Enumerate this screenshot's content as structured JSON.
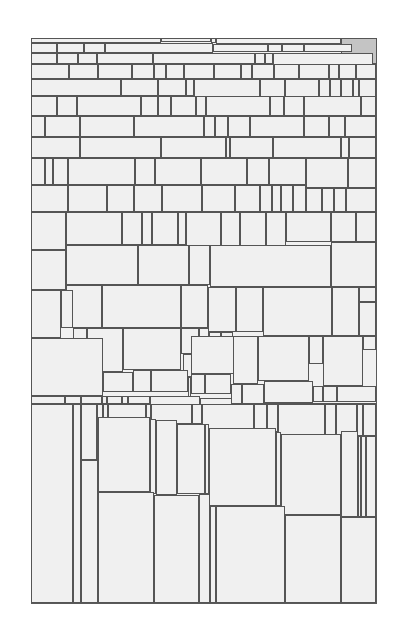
{
  "diagram": {
    "type": "rectangle-tiling",
    "frame": {
      "x": 31,
      "y": 38,
      "w": 346,
      "h": 566
    },
    "colors": {
      "background": "#ffffff",
      "cell_fill": "#f0f0f0",
      "border": "#555555",
      "shaded_fill": "#c4c4c4"
    },
    "cells": [
      [
        31,
        38,
        130,
        5
      ],
      [
        161,
        38,
        50,
        4
      ],
      [
        211,
        38,
        5,
        5
      ],
      [
        216,
        38,
        125,
        6
      ],
      [
        341,
        38,
        36,
        26,
        1
      ],
      [
        31,
        43,
        26,
        10
      ],
      [
        57,
        43,
        27,
        10
      ],
      [
        84,
        43,
        21,
        10
      ],
      [
        105,
        43,
        108,
        10
      ],
      [
        213,
        44,
        55,
        8
      ],
      [
        268,
        44,
        14,
        8
      ],
      [
        282,
        44,
        22,
        8
      ],
      [
        304,
        44,
        48,
        8
      ],
      [
        31,
        53,
        26,
        11
      ],
      [
        57,
        53,
        21,
        11
      ],
      [
        78,
        53,
        19,
        11
      ],
      [
        97,
        53,
        56,
        11
      ],
      [
        153,
        53,
        102,
        11
      ],
      [
        255,
        53,
        10,
        11
      ],
      [
        265,
        53,
        8,
        11
      ],
      [
        273,
        53,
        100,
        12
      ],
      [
        31,
        64,
        38,
        15
      ],
      [
        69,
        64,
        29,
        15
      ],
      [
        98,
        64,
        34,
        15
      ],
      [
        132,
        64,
        22,
        15
      ],
      [
        154,
        64,
        12,
        15
      ],
      [
        166,
        64,
        18,
        15
      ],
      [
        184,
        64,
        30,
        15
      ],
      [
        214,
        64,
        27,
        15
      ],
      [
        241,
        64,
        11,
        15
      ],
      [
        252,
        64,
        22,
        15
      ],
      [
        274,
        64,
        25,
        15
      ],
      [
        299,
        64,
        30,
        15
      ],
      [
        329,
        64,
        10,
        15
      ],
      [
        339,
        64,
        17,
        15
      ],
      [
        356,
        64,
        20,
        15
      ],
      [
        31,
        79,
        90,
        17
      ],
      [
        121,
        79,
        37,
        17
      ],
      [
        158,
        79,
        28,
        17
      ],
      [
        186,
        79,
        8,
        17
      ],
      [
        194,
        79,
        66,
        18
      ],
      [
        260,
        79,
        25,
        18
      ],
      [
        285,
        79,
        34,
        18
      ],
      [
        319,
        79,
        11,
        18
      ],
      [
        330,
        79,
        11,
        18
      ],
      [
        341,
        79,
        12,
        18
      ],
      [
        353,
        79,
        6,
        18
      ],
      [
        359,
        79,
        17,
        18
      ],
      [
        31,
        96,
        26,
        20
      ],
      [
        57,
        96,
        20,
        20
      ],
      [
        77,
        96,
        64,
        20
      ],
      [
        141,
        96,
        17,
        20
      ],
      [
        158,
        96,
        13,
        20
      ],
      [
        171,
        96,
        25,
        20
      ],
      [
        196,
        96,
        10,
        20
      ],
      [
        206,
        96,
        64,
        20
      ],
      [
        270,
        96,
        14,
        20
      ],
      [
        284,
        96,
        20,
        20
      ],
      [
        304,
        96,
        57,
        20
      ],
      [
        361,
        96,
        15,
        20
      ],
      [
        31,
        116,
        14,
        21
      ],
      [
        45,
        116,
        35,
        21
      ],
      [
        80,
        116,
        54,
        21
      ],
      [
        134,
        116,
        70,
        21
      ],
      [
        204,
        116,
        11,
        21
      ],
      [
        215,
        116,
        13,
        21
      ],
      [
        228,
        116,
        22,
        21
      ],
      [
        250,
        116,
        54,
        21
      ],
      [
        304,
        116,
        25,
        21
      ],
      [
        329,
        116,
        16,
        21
      ],
      [
        345,
        116,
        31,
        21
      ],
      [
        31,
        137,
        49,
        21
      ],
      [
        80,
        137,
        81,
        21
      ],
      [
        161,
        137,
        65,
        21
      ],
      [
        226,
        137,
        4,
        21
      ],
      [
        230,
        137,
        43,
        21
      ],
      [
        273,
        137,
        68,
        21
      ],
      [
        341,
        137,
        8,
        21
      ],
      [
        349,
        137,
        27,
        21
      ],
      [
        31,
        158,
        14,
        27
      ],
      [
        45,
        158,
        8,
        27
      ],
      [
        53,
        158,
        15,
        27
      ],
      [
        68,
        158,
        67,
        27
      ],
      [
        135,
        158,
        20,
        27
      ],
      [
        155,
        158,
        46,
        27
      ],
      [
        201,
        158,
        46,
        27
      ],
      [
        247,
        158,
        22,
        27
      ],
      [
        269,
        158,
        37,
        27
      ],
      [
        306,
        158,
        42,
        30
      ],
      [
        348,
        158,
        28,
        30
      ],
      [
        31,
        185,
        37,
        27
      ],
      [
        68,
        185,
        39,
        27
      ],
      [
        107,
        185,
        27,
        27
      ],
      [
        134,
        185,
        28,
        27
      ],
      [
        162,
        185,
        40,
        27
      ],
      [
        202,
        185,
        33,
        27
      ],
      [
        235,
        185,
        25,
        27
      ],
      [
        260,
        185,
        12,
        27
      ],
      [
        272,
        185,
        9,
        27
      ],
      [
        281,
        185,
        12,
        27
      ],
      [
        293,
        185,
        13,
        27
      ],
      [
        306,
        188,
        16,
        24
      ],
      [
        322,
        188,
        12,
        24
      ],
      [
        334,
        188,
        12,
        24
      ],
      [
        346,
        188,
        30,
        24
      ],
      [
        31,
        212,
        35,
        38
      ],
      [
        66,
        212,
        56,
        33
      ],
      [
        122,
        212,
        20,
        33
      ],
      [
        142,
        212,
        10,
        33
      ],
      [
        152,
        212,
        26,
        33
      ],
      [
        178,
        212,
        8,
        33
      ],
      [
        186,
        212,
        35,
        34
      ],
      [
        221,
        212,
        19,
        34
      ],
      [
        240,
        212,
        26,
        34
      ],
      [
        266,
        212,
        20,
        34
      ],
      [
        286,
        212,
        45,
        30
      ],
      [
        331,
        212,
        25,
        30
      ],
      [
        356,
        212,
        20,
        30
      ],
      [
        66,
        245,
        72,
        40
      ],
      [
        138,
        245,
        51,
        40
      ],
      [
        189,
        245,
        21,
        40
      ],
      [
        210,
        245,
        121,
        42
      ],
      [
        331,
        242,
        45,
        45
      ],
      [
        31,
        250,
        35,
        40
      ],
      [
        31,
        290,
        30,
        48
      ],
      [
        66,
        285,
        36,
        43
      ],
      [
        102,
        285,
        79,
        43
      ],
      [
        181,
        285,
        27,
        43
      ],
      [
        208,
        287,
        28,
        45
      ],
      [
        236,
        287,
        27,
        45
      ],
      [
        263,
        287,
        69,
        49
      ],
      [
        332,
        287,
        27,
        49
      ],
      [
        359,
        287,
        17,
        15
      ],
      [
        359,
        302,
        17,
        34
      ],
      [
        61,
        290,
        12,
        38
      ],
      [
        73,
        328,
        14,
        16
      ],
      [
        87,
        328,
        36,
        44
      ],
      [
        123,
        328,
        58,
        42
      ],
      [
        181,
        328,
        18,
        26
      ],
      [
        199,
        328,
        10,
        26
      ],
      [
        183,
        354,
        16,
        23
      ],
      [
        209,
        332,
        12,
        28
      ],
      [
        221,
        332,
        12,
        28
      ],
      [
        191,
        336,
        58,
        38
      ],
      [
        233,
        336,
        25,
        48
      ],
      [
        258,
        336,
        51,
        45
      ],
      [
        309,
        336,
        14,
        28
      ],
      [
        323,
        336,
        40,
        50
      ],
      [
        363,
        336,
        13,
        14
      ],
      [
        31,
        338,
        72,
        58
      ],
      [
        103,
        372,
        30,
        20
      ],
      [
        133,
        370,
        18,
        22
      ],
      [
        151,
        370,
        37,
        22
      ],
      [
        188,
        377,
        3,
        20
      ],
      [
        191,
        374,
        14,
        20
      ],
      [
        205,
        374,
        26,
        20
      ],
      [
        231,
        384,
        11,
        20
      ],
      [
        242,
        384,
        22,
        20
      ],
      [
        264,
        381,
        49,
        22
      ],
      [
        313,
        386,
        10,
        16
      ],
      [
        323,
        386,
        14,
        16
      ],
      [
        337,
        386,
        39,
        16
      ],
      [
        31,
        396,
        34,
        8
      ],
      [
        65,
        396,
        16,
        8
      ],
      [
        81,
        396,
        21,
        8
      ],
      [
        102,
        396,
        5,
        8
      ],
      [
        107,
        396,
        15,
        8
      ],
      [
        122,
        396,
        6,
        8
      ],
      [
        128,
        396,
        22,
        8
      ],
      [
        150,
        396,
        50,
        17
      ],
      [
        200,
        398,
        32,
        30
      ],
      [
        232,
        403,
        14,
        18
      ],
      [
        246,
        403,
        12,
        20
      ],
      [
        258,
        403,
        29,
        6
      ],
      [
        287,
        403,
        17,
        6
      ],
      [
        304,
        403,
        22,
        6
      ],
      [
        326,
        403,
        18,
        6
      ],
      [
        344,
        403,
        22,
        6
      ],
      [
        366,
        403,
        10,
        6
      ],
      [
        31,
        404,
        42,
        199
      ],
      [
        73,
        404,
        8,
        199
      ],
      [
        81,
        404,
        16,
        56
      ],
      [
        97,
        404,
        6,
        56
      ],
      [
        103,
        404,
        5,
        56
      ],
      [
        108,
        404,
        38,
        15
      ],
      [
        146,
        404,
        5,
        15
      ],
      [
        151,
        404,
        41,
        20
      ],
      [
        192,
        404,
        10,
        20
      ],
      [
        202,
        404,
        52,
        28
      ],
      [
        254,
        404,
        13,
        28
      ],
      [
        267,
        404,
        11,
        28
      ],
      [
        278,
        404,
        47,
        33
      ],
      [
        325,
        404,
        11,
        33
      ],
      [
        336,
        404,
        21,
        32
      ],
      [
        357,
        404,
        6,
        32
      ],
      [
        363,
        404,
        13,
        32
      ],
      [
        81,
        460,
        17,
        143
      ],
      [
        98,
        417,
        52,
        75
      ],
      [
        150,
        419,
        6,
        75
      ],
      [
        156,
        420,
        21,
        75
      ],
      [
        177,
        424,
        28,
        70
      ],
      [
        205,
        424,
        4,
        70
      ],
      [
        209,
        428,
        67,
        78
      ],
      [
        276,
        432,
        5,
        74
      ],
      [
        281,
        434,
        60,
        81
      ],
      [
        341,
        431,
        17,
        86
      ],
      [
        358,
        436,
        3,
        81
      ],
      [
        361,
        436,
        5,
        81
      ],
      [
        366,
        436,
        10,
        81
      ],
      [
        98,
        492,
        56,
        111
      ],
      [
        154,
        495,
        45,
        108
      ],
      [
        199,
        494,
        11,
        109
      ],
      [
        210,
        506,
        6,
        97
      ],
      [
        216,
        506,
        69,
        97
      ],
      [
        285,
        515,
        56,
        88
      ],
      [
        341,
        517,
        35,
        86
      ]
    ]
  }
}
